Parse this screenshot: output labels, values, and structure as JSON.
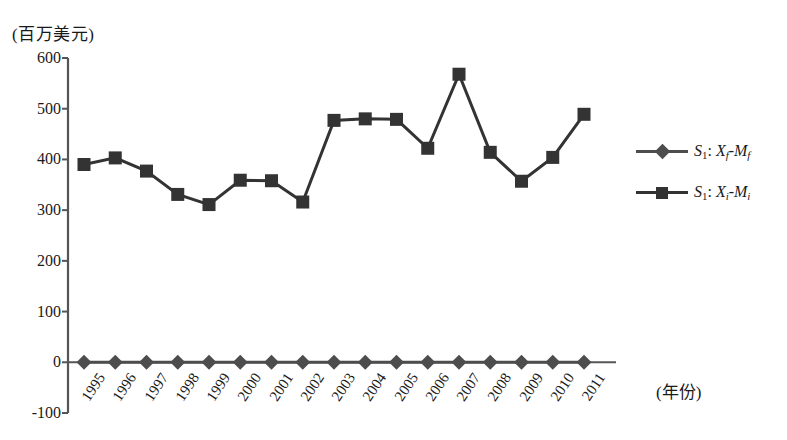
{
  "chart_data": {
    "type": "line",
    "title": "",
    "subtitle": "",
    "xlabel": "(年份)",
    "ylabel": "(百万美元)",
    "x": [
      1995,
      1996,
      1997,
      1998,
      1999,
      2000,
      2001,
      2002,
      2003,
      2004,
      2005,
      2006,
      2007,
      2008,
      2009,
      2010,
      2011
    ],
    "xtick_labels": [
      "1995",
      "1996",
      "1997",
      "1998",
      "1999",
      "2000",
      "2001",
      "2002",
      "2003",
      "2004",
      "2005",
      "2006",
      "2007",
      "2008",
      "2009",
      "2010",
      "2011"
    ],
    "ytick_labels": [
      "600",
      "500",
      "400",
      "300",
      "200",
      "100",
      "0",
      "-100"
    ],
    "yticks": [
      600,
      500,
      400,
      300,
      200,
      100,
      0,
      -100
    ],
    "ylim": [
      -100,
      600
    ],
    "grid": false,
    "legend_position": "right",
    "series": [
      {
        "name": "S1: Xf-Mf",
        "marker": "diamond",
        "color": "#4d4d4d",
        "values": [
          0,
          0,
          0,
          0,
          0,
          0,
          0,
          0,
          0,
          0,
          0,
          0,
          0,
          0,
          0,
          0,
          0
        ]
      },
      {
        "name": "S1: Xi-Mi",
        "marker": "square",
        "color": "#333333",
        "values": [
          390,
          403,
          377,
          331,
          311,
          359,
          358,
          316,
          477,
          480,
          479,
          422,
          568,
          414,
          357,
          404,
          489
        ]
      }
    ]
  },
  "legend": {
    "items": [
      {
        "marker": "diamond",
        "series_prefix": "S",
        "series_sub": "1",
        "colon": ": ",
        "term1": "X",
        "term1_sub": "f",
        "dash": "-",
        "term2": "M",
        "term2_sub": "f"
      },
      {
        "marker": "square",
        "series_prefix": "S",
        "series_sub": "1",
        "colon": ": ",
        "term1": "X",
        "term1_sub": "i",
        "dash": "-",
        "term2": "M",
        "term2_sub": "i"
      }
    ]
  },
  "colors": {
    "axis": "#555555",
    "series_diamond": "#4d4d4d",
    "series_square": "#333333",
    "text": "#1a1a1a",
    "background": "#ffffff"
  }
}
